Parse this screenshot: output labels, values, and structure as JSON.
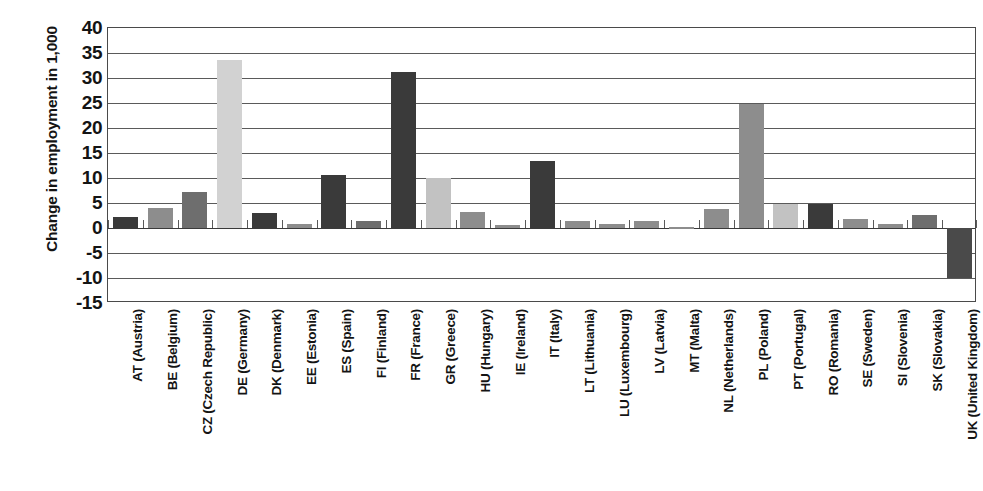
{
  "chart_data": {
    "type": "bar",
    "title": "",
    "xlabel": "",
    "ylabel": "Change in employment in 1,000",
    "ylim": [
      -15,
      40
    ],
    "ytick_step": 5,
    "yticks": [
      "40",
      "35",
      "30",
      "25",
      "20",
      "15",
      "10",
      "5",
      "0",
      "-5",
      "-10",
      "-15"
    ],
    "grid": true,
    "legend": "none",
    "categories": [
      "AT (Austria)",
      "BE (Belgium)",
      "CZ (Czech Republic)",
      "DE (Germany)",
      "DK (Denmark)",
      "EE (Estonia)",
      "ES (Spain)",
      "FI (Finland)",
      "FR (France)",
      "GR (Greece)",
      "HU (Hungary)",
      "IE (Ireland)",
      "IT (Italy)",
      "LT (Lithuania)",
      "LU (Luxembourg)",
      "LV (Latvia)",
      "MT (Malta)",
      "NL (Netherlands)",
      "PL (Poland)",
      "PT (Portugal)",
      "RO (Romania)",
      "SE (Sweden)",
      "SI (Slovenia)",
      "SK (Slovakia)",
      "UK (United Kingdom)"
    ],
    "values": [
      2.2,
      4.0,
      7.3,
      33.7,
      3.0,
      0.8,
      10.7,
      1.4,
      31.3,
      10.1,
      3.3,
      0.6,
      13.5,
      1.5,
      0.8,
      1.5,
      0.2,
      3.8,
      24.9,
      4.8,
      4.8,
      1.8,
      0.8,
      2.6,
      -9.9
    ],
    "bar_colors": [
      "#3a3a3a",
      "#8d8d8d",
      "#6e6e6e",
      "#d2d2d2",
      "#3a3a3a",
      "#8d8d8d",
      "#3a3a3a",
      "#6e6e6e",
      "#3a3a3a",
      "#c2c2c2",
      "#8d8d8d",
      "#8d8d8d",
      "#3a3a3a",
      "#8d8d8d",
      "#8d8d8d",
      "#8d8d8d",
      "#8d8d8d",
      "#8d8d8d",
      "#8d8d8d",
      "#c2c2c2",
      "#3a3a3a",
      "#8d8d8d",
      "#8d8d8d",
      "#6e6e6e",
      "#4a4a4a"
    ],
    "axis_color": "#4a4a4a",
    "grid_color": "#5a5a5a",
    "text_color": "#141414",
    "background": "#ffffff"
  }
}
